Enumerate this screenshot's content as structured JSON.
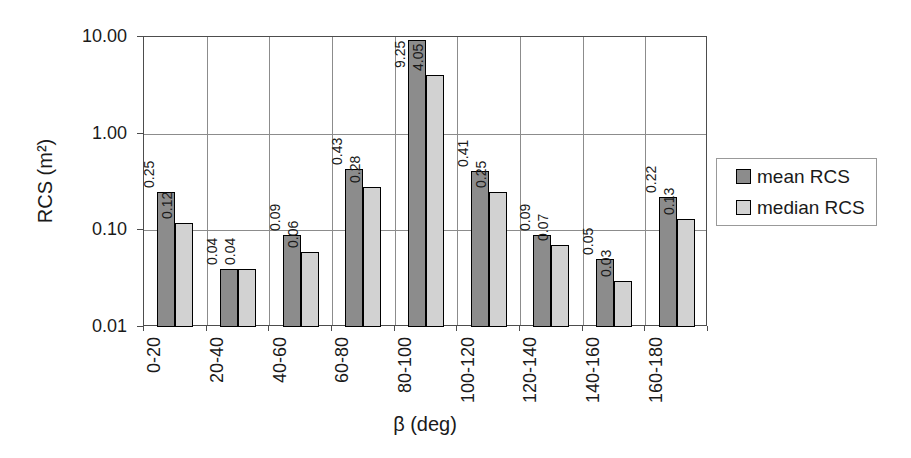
{
  "chart_data": {
    "type": "bar",
    "title": "",
    "categories": [
      "0-20",
      "20-40",
      "40-60",
      "60-80",
      "80-100",
      "100-120",
      "120-140",
      "140-160",
      "160-180"
    ],
    "series": [
      {
        "name": "mean RCS",
        "color": "#8c8c8c",
        "values": [
          0.25,
          0.04,
          0.09,
          0.43,
          9.25,
          0.41,
          0.09,
          0.05,
          0.22
        ]
      },
      {
        "name": "median RCS",
        "color": "#d2d2d2",
        "values": [
          0.12,
          0.04,
          0.06,
          0.28,
          4.05,
          0.25,
          0.07,
          0.03,
          0.13
        ]
      }
    ],
    "xlabel": "β (deg)",
    "ylabel": "RCS (m²)",
    "yscale": "log",
    "ylim": [
      0.01,
      10
    ],
    "ytick_labels": [
      "10.00",
      "1.00",
      "0.10",
      "0.01"
    ],
    "ytick_values": [
      10,
      1,
      0.1,
      0.01
    ],
    "grid": true,
    "legend_position": "right",
    "data_labels": true,
    "data_label_format": "0.00"
  },
  "colors": {
    "background": "#ffffff",
    "text": "#1a1a1a",
    "grid": "#8c8c8c",
    "plot_border": "#4d4d4d",
    "bar_border": "#000000",
    "legend_border": "#999999",
    "mean_fill": "#8c8c8c",
    "median_fill": "#d2d2d2"
  }
}
